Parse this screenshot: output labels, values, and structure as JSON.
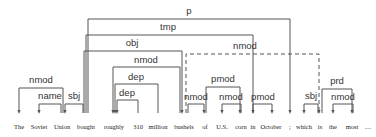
{
  "diagram": {
    "type": "dependency-parse",
    "words": [
      {
        "text": "The",
        "x": 19
      },
      {
        "text": "Soviet",
        "x": 39
      },
      {
        "text": "Union",
        "x": 62
      },
      {
        "text": "bought",
        "x": 86
      },
      {
        "text": "roughly",
        "x": 114
      },
      {
        "text": "310",
        "x": 138
      },
      {
        "text": "million",
        "x": 158
      },
      {
        "text": "bushels",
        "x": 184
      },
      {
        "text": "of",
        "x": 205
      },
      {
        "text": "U.S.",
        "x": 222
      },
      {
        "text": "corn",
        "x": 241
      },
      {
        "text": "in",
        "x": 253
      },
      {
        "text": "October",
        "x": 271
      },
      {
        "text": ";",
        "x": 290
      },
      {
        "text": "which",
        "x": 304
      },
      {
        "text": "is",
        "x": 320
      },
      {
        "text": "the",
        "x": 333
      },
      {
        "text": "most",
        "x": 352
      },
      {
        "text": "…",
        "x": 368
      }
    ],
    "arcs": [
      {
        "label": "p",
        "from_x": 88,
        "to_x": 290,
        "y": 19,
        "dashed": false,
        "label_x": 189,
        "label_y": 14
      },
      {
        "label": "tmp",
        "from_x": 86,
        "to_x": 253,
        "y": 35,
        "dashed": false,
        "label_x": 168,
        "label_y": 30
      },
      {
        "label": "obj",
        "from_x": 84,
        "to_x": 182,
        "y": 51,
        "dashed": false,
        "label_x": 132,
        "label_y": 46
      },
      {
        "label": "nmod",
        "from_x": 186,
        "to_x": 319,
        "y": 54,
        "dashed": true,
        "label_x": 245,
        "label_y": 49
      },
      {
        "label": "nmod",
        "from_x": 180,
        "to_x": 113,
        "y": 67,
        "dashed": false,
        "label_x": 146,
        "label_y": 63
      },
      {
        "label": "dep",
        "from_x": 158,
        "to_x": 115,
        "y": 84,
        "dashed": false,
        "label_x": 136,
        "label_y": 80
      },
      {
        "label": "dep",
        "from_x": 138,
        "to_x": 117,
        "y": 100,
        "dashed": false,
        "label_x": 127,
        "label_y": 96
      },
      {
        "label": "pmod",
        "from_x": 206,
        "to_x": 240,
        "y": 87,
        "dashed": false,
        "label_x": 223,
        "label_y": 82
      },
      {
        "label": "nmod",
        "from_x": 188,
        "to_x": 204,
        "y": 104,
        "dashed": false,
        "label_x": 196,
        "label_y": 100
      },
      {
        "label": "nmod",
        "from_x": 241,
        "to_x": 222,
        "y": 104,
        "dashed": false,
        "label_x": 231,
        "label_y": 100
      },
      {
        "label": "pmod",
        "from_x": 253,
        "to_x": 272,
        "y": 104,
        "dashed": false,
        "label_x": 263,
        "label_y": 100
      },
      {
        "label": "nmod",
        "from_x": 63,
        "to_x": 19,
        "y": 88,
        "dashed": false,
        "label_x": 41,
        "label_y": 83
      },
      {
        "label": "name",
        "from_x": 61,
        "to_x": 39,
        "y": 104,
        "dashed": false,
        "label_x": 50,
        "label_y": 99
      },
      {
        "label": "sbj",
        "from_x": 83,
        "to_x": 65,
        "y": 104,
        "dashed": false,
        "label_x": 74,
        "label_y": 99
      },
      {
        "label": "sbj",
        "from_x": 318,
        "to_x": 304,
        "y": 104,
        "dashed": false,
        "label_x": 311,
        "label_y": 99
      },
      {
        "label": "prd",
        "from_x": 322,
        "to_x": 352,
        "y": 89,
        "dashed": false,
        "label_x": 337,
        "label_y": 84
      },
      {
        "label": "nmod",
        "from_x": 353,
        "to_x": 333,
        "y": 104,
        "dashed": false,
        "label_x": 343,
        "label_y": 100
      }
    ],
    "colors": {
      "line": "#555555",
      "text": "#222222",
      "label": "#333333",
      "background": "#ffffff"
    }
  }
}
